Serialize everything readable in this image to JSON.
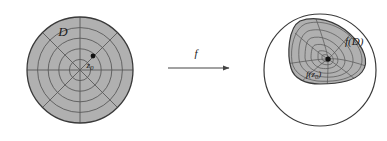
{
  "figure": {
    "background_color": "#ffffff"
  },
  "colors": {
    "disk_fill": "#b0b0b0",
    "grid_line": "#5a5a5a",
    "outline": "#3a3a3a",
    "point": "#111111",
    "text": "#1a1a1a",
    "arrow": "#444444"
  },
  "domain_panel": {
    "name": "domain-disk",
    "label": "D",
    "center": {
      "x": 80,
      "y": 70
    },
    "radius": 53,
    "grid": {
      "ring_count": 5,
      "ring_radii": [
        10.6,
        21.2,
        31.8,
        42.4,
        53
      ],
      "spoke_count": 8,
      "spoke_angles_deg": [
        0,
        45,
        90,
        135,
        180,
        225,
        270,
        315
      ]
    },
    "marked_point": {
      "name": "z0",
      "label": "z",
      "subscript": "0",
      "x": 93,
      "y": 56
    }
  },
  "arrow": {
    "name": "map-arrow",
    "label": "f",
    "x1": 168,
    "y1": 68,
    "x2": 229,
    "y2": 68,
    "label_x": 196,
    "label_y": 57
  },
  "codomain_panel": {
    "name": "codomain-disk",
    "outer_circle": {
      "center": {
        "x": 320,
        "y": 70
      },
      "radius": 56
    },
    "image_region": {
      "name": "image-of-D",
      "label": "f(D)",
      "label_x": 345,
      "label_y": 44,
      "grid": {
        "ring_count": 5,
        "spoke_count": 8
      }
    },
    "marked_point": {
      "name": "f-of-z0",
      "label": "f(z",
      "subscript": "0",
      "label_tail": ")",
      "x": 328,
      "y": 59,
      "label_x": 307,
      "label_y": 75
    }
  }
}
